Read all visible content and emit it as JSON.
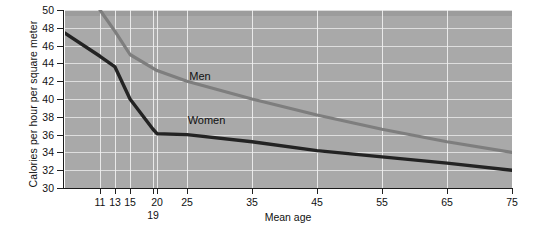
{
  "chart_data": {
    "type": "line",
    "title": "",
    "xlabel": "Mean age",
    "ylabel": "Calories per hour per square meter",
    "xlim": [
      9,
      75
    ],
    "ylim": [
      30,
      50
    ],
    "grid": true,
    "legend_position": "inline-labels",
    "background_color": "#a9a9a9",
    "gridline_color": "#e8e8e8",
    "y_ticks": [
      30,
      32,
      34,
      36,
      38,
      40,
      42,
      44,
      46,
      48,
      50
    ],
    "x_ticks": [
      11,
      13,
      15,
      19,
      20,
      25,
      35,
      45,
      55,
      65,
      75
    ],
    "x_tick_labels": [
      "11",
      "13",
      "15",
      "19",
      "20",
      "25",
      "35",
      "45",
      "55",
      "65",
      "75"
    ],
    "series": [
      {
        "name": "Men",
        "color": "#7e7e7e",
        "x": [
          11,
          13,
          15,
          20,
          25,
          35,
          45,
          55,
          65,
          75
        ],
        "values": [
          50.0,
          47.6,
          45.0,
          43.2,
          42.0,
          40.0,
          38.2,
          36.6,
          35.2,
          34.0
        ]
      },
      {
        "name": "Women",
        "color": "#232323",
        "x": [
          9,
          11,
          13,
          15,
          19,
          20,
          25,
          35,
          45,
          55,
          65,
          75
        ],
        "values": [
          47.4,
          44.8,
          43.6,
          40.0,
          36.6,
          36.1,
          36.0,
          35.2,
          34.2,
          33.5,
          32.8,
          32.0
        ]
      }
    ],
    "annotations": [
      {
        "text": "Men",
        "x": 27,
        "y": 42.6
      },
      {
        "text": "Women",
        "x": 28,
        "y": 37.6
      }
    ]
  },
  "axis": {
    "y_title": "Calories per hour per square meter",
    "x_title": "Mean age",
    "y_labels": [
      "50",
      "48",
      "46",
      "44",
      "42",
      "40",
      "38",
      "36",
      "34",
      "32",
      "30"
    ],
    "x_labels_row1": [
      "11",
      "13",
      "15",
      "20",
      "25",
      "35",
      "45",
      "55",
      "65",
      "75"
    ],
    "x_labels_row2": [
      "19"
    ]
  },
  "series_labels": {
    "men": "Men",
    "women": "Women"
  }
}
